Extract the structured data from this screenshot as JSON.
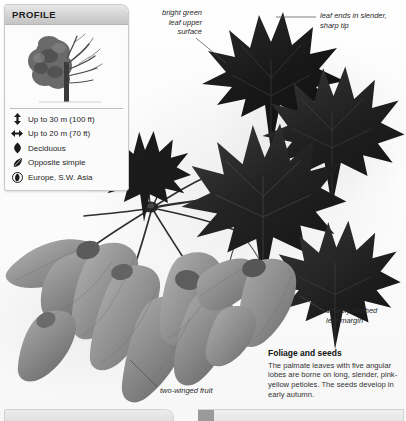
{
  "profile": {
    "title": "PROFILE",
    "thumbnail_name": "tree-silhouette-half-foliage",
    "rows": [
      {
        "icon": "height-arrow-icon",
        "text": "Up to 30 m (100 ft)"
      },
      {
        "icon": "spread-arrow-icon",
        "text": "Up to 20 m (70 ft)"
      },
      {
        "icon": "falling-leaf-icon",
        "text": "Deciduous"
      },
      {
        "icon": "simple-leaf-icon",
        "text": "Opposite simple"
      },
      {
        "icon": "globe-location-icon",
        "text": "Europe, S.W. Asia"
      }
    ]
  },
  "annotations": {
    "upper_surface": "bright green\nleaf upper\nsurface",
    "leaf_tip": "leaf ends in slender,\nsharp tip",
    "leaf_margin": "sharply toothed\nleaf margin",
    "fruit": "two-winged fruit"
  },
  "caption": {
    "title": "Foliage and seeds",
    "body": "The palmate leaves with five angular lobes are borne on long, slender, pink-yellow petioles. The seeds develop in early autumn."
  },
  "colors": {
    "leaf_dark": "#1c1c1c",
    "leaf_mid": "#3a3a3a",
    "samara_gray": "#8d8d8d",
    "panel_gray": "#d6d6d6",
    "text_dark": "#1f1f1f"
  }
}
